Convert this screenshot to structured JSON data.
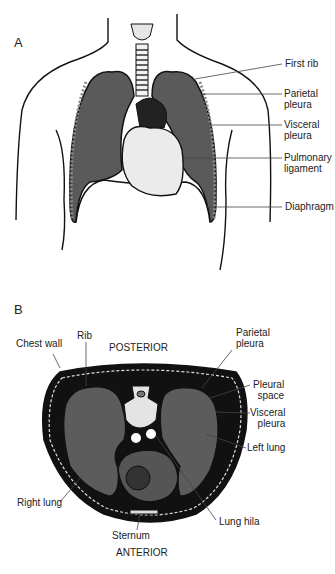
{
  "figure": {
    "panel_a": {
      "letter": "A",
      "view": "frontal thorax",
      "labels": [
        {
          "id": "first-rib",
          "line1": "First rib",
          "line2": ""
        },
        {
          "id": "parietal-pleura",
          "line1": "Parietal",
          "line2": "pleura"
        },
        {
          "id": "visceral-pleura",
          "line1": "Visceral",
          "line2": "pleura"
        },
        {
          "id": "pulmonary-ligament",
          "line1": "Pulmonary",
          "line2": "ligament"
        },
        {
          "id": "diaphragm",
          "line1": "Diaphragm",
          "line2": ""
        }
      ]
    },
    "panel_b": {
      "letter": "B",
      "view": "transverse cross-section",
      "orientation_top": "POSTERIOR",
      "orientation_bottom": "ANTERIOR",
      "labels": [
        {
          "id": "chest-wall",
          "line1": "Chest wall",
          "line2": ""
        },
        {
          "id": "rib",
          "line1": "Rib",
          "line2": ""
        },
        {
          "id": "parietal-pleura",
          "line1": "Parietal",
          "line2": "pleura"
        },
        {
          "id": "pleural-space",
          "line1": "Pleural",
          "line2": "space"
        },
        {
          "id": "visceral-pleura",
          "line1": "Visceral",
          "line2": "pleura"
        },
        {
          "id": "left-lung",
          "line1": "Left lung",
          "line2": ""
        },
        {
          "id": "right-lung",
          "line1": "Right lung",
          "line2": ""
        },
        {
          "id": "sternum",
          "line1": "Sternum",
          "line2": ""
        },
        {
          "id": "lung-hila",
          "line1": "Lung hila",
          "line2": ""
        }
      ]
    },
    "colors": {
      "lung": "#5a5a5a",
      "outline": "#111111",
      "heart": "#e8e8e8",
      "leader": "#444444"
    }
  }
}
